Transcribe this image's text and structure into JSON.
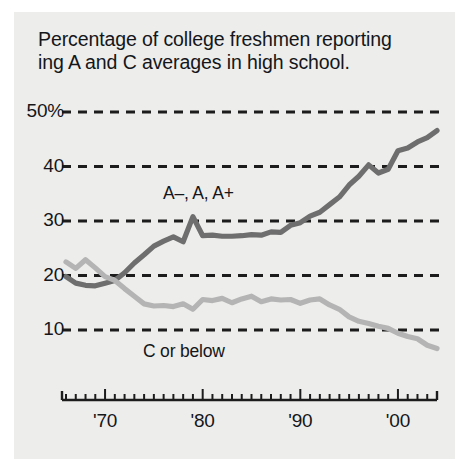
{
  "figure": {
    "background": "#ffffff",
    "panel_color": "#ededeb",
    "title": "Percentage of college freshmen reporting\ning A and C averages in high school."
  },
  "axes": {
    "y_ticks": [
      {
        "value": 50,
        "label": "50%"
      },
      {
        "value": 40,
        "label": "40"
      },
      {
        "value": 30,
        "label": "30"
      },
      {
        "value": 20,
        "label": "20"
      },
      {
        "value": 10,
        "label": "10"
      }
    ],
    "x_ticks": [
      {
        "value": 1970,
        "label": "'70"
      },
      {
        "value": 1980,
        "label": "'80"
      },
      {
        "value": 1990,
        "label": "'90"
      },
      {
        "value": 2000,
        "label": "'00"
      }
    ],
    "grid_color": "#1c1c1c",
    "axis_color": "#1c1c1c"
  },
  "annotations": [
    {
      "name": "series-label-a",
      "text": "A–, A, A+"
    },
    {
      "name": "series-label-c",
      "text": "C or below"
    }
  ],
  "chart_data": {
    "type": "line",
    "xlabel": "",
    "ylabel": "Percent",
    "xlim": [
      1966,
      2004
    ],
    "ylim": [
      4,
      52
    ],
    "grid": true,
    "gridlines": [
      10,
      20,
      30,
      40,
      50
    ],
    "legend_position": "inline-annotation",
    "x": [
      1966,
      1967,
      1968,
      1969,
      1970,
      1971,
      1972,
      1973,
      1974,
      1975,
      1976,
      1977,
      1978,
      1979,
      1980,
      1981,
      1982,
      1983,
      1984,
      1985,
      1986,
      1987,
      1988,
      1989,
      1990,
      1991,
      1992,
      1993,
      1994,
      1995,
      1996,
      1997,
      1998,
      1999,
      2000,
      2001,
      2002,
      2003,
      2004
    ],
    "series": [
      {
        "name": "A–, A, A+",
        "color": "#6e6e6e",
        "values": [
          19.8,
          18.6,
          18.2,
          18.1,
          18.6,
          19.1,
          20.5,
          22.3,
          23.8,
          25.4,
          26.3,
          27.1,
          26.2,
          30.8,
          27.3,
          27.4,
          27.2,
          27.2,
          27.3,
          27.5,
          27.4,
          28.0,
          27.9,
          29.2,
          29.7,
          30.9,
          31.6,
          33.0,
          34.4,
          36.6,
          38.2,
          40.3,
          38.8,
          39.5,
          42.9,
          43.4,
          44.5,
          45.3,
          46.6
        ]
      },
      {
        "name": "C or below",
        "color": "#b4b4b4",
        "values": [
          22.5,
          21.3,
          22.9,
          21.4,
          19.8,
          19.1,
          17.6,
          16.2,
          14.8,
          14.4,
          14.5,
          14.3,
          14.8,
          13.8,
          15.6,
          15.4,
          15.8,
          15.0,
          15.7,
          16.2,
          15.2,
          15.7,
          15.5,
          15.6,
          14.9,
          15.5,
          15.7,
          14.6,
          13.8,
          12.4,
          11.6,
          11.2,
          10.7,
          10.3,
          9.4,
          8.8,
          8.4,
          7.2,
          6.6
        ]
      }
    ]
  }
}
